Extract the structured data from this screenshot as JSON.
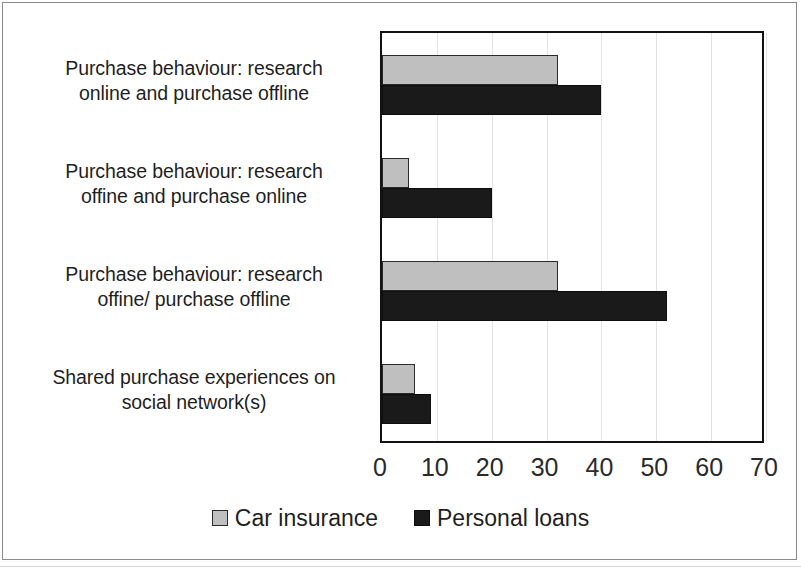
{
  "chart_data": {
    "type": "bar",
    "orientation": "horizontal",
    "title": "",
    "xlabel": "",
    "ylabel": "",
    "xlim": [
      0,
      70
    ],
    "xticks": [
      0,
      10,
      20,
      30,
      40,
      50,
      60,
      70
    ],
    "grid": true,
    "legend_position": "bottom",
    "categories": [
      "Purchase behaviour: research online and purchase offline",
      "Purchase behaviour: research offine and purchase online",
      "Purchase behaviour: research offine/ purchase offline",
      "Shared purchase experiences on social network(s)"
    ],
    "category_lines": [
      [
        "Purchase behaviour: research",
        "online and purchase offline"
      ],
      [
        "Purchase behaviour: research",
        "offine and purchase online"
      ],
      [
        "Purchase behaviour: research",
        "offine/ purchase offline"
      ],
      [
        "Shared purchase experiences on",
        "social network(s)"
      ]
    ],
    "series": [
      {
        "name": "Car insurance",
        "color": "#bfbfbf",
        "values": [
          32,
          5,
          32,
          6
        ]
      },
      {
        "name": "Personal loans",
        "color": "#1a1a1a",
        "values": [
          40,
          20,
          52,
          9
        ]
      }
    ]
  },
  "axis": {
    "tick_labels": [
      "0",
      "10",
      "20",
      "30",
      "40",
      "50",
      "60",
      "70"
    ]
  },
  "legend": {
    "items": [
      {
        "label": "Car insurance",
        "swatch": "car"
      },
      {
        "label": "Personal loans",
        "swatch": "loans"
      }
    ]
  }
}
